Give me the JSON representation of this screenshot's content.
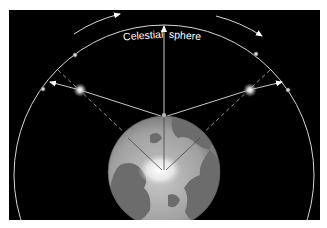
{
  "diagram": {
    "labels": {
      "left": "Celestial",
      "right": "sphere"
    },
    "colors": {
      "background": "#ffffff",
      "space": "#000000",
      "lines": "#e8e8e8",
      "earth_ocean": "#a8a8a8",
      "earth_land": "#6a6a6a",
      "ice": "#f4f4f4"
    },
    "elements": [
      "celestial-sphere-circle",
      "earth-globe",
      "zenith-vector",
      "star-vectors",
      "rotation-arrows"
    ]
  }
}
